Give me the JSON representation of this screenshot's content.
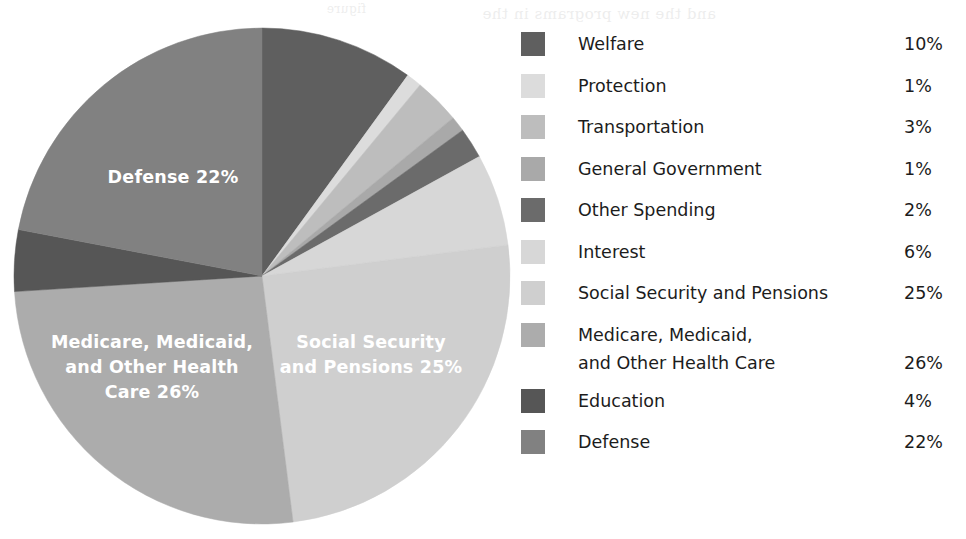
{
  "chart_data": {
    "type": "pie",
    "title": "",
    "subtitle": "",
    "xlabel": "",
    "ylabel": "",
    "legend_position": "right",
    "grid": false,
    "unit": "%",
    "total": 100,
    "categories": [
      "Welfare",
      "Protection",
      "Transportation",
      "General Government",
      "Other Spending",
      "Interest",
      "Social Security and Pensions",
      "Medicare, Medicaid, and Other Health Care",
      "Education",
      "Defense"
    ],
    "values": [
      10,
      1,
      3,
      1,
      2,
      6,
      25,
      26,
      4,
      22
    ],
    "colors": [
      "#5f5f5f",
      "#dcdcdc",
      "#bdbdbd",
      "#a9a9a9",
      "#6b6b6b",
      "#d7d7d7",
      "#cfcfcf",
      "#acacac",
      "#565656",
      "#818181"
    ],
    "slices": [
      {
        "label": "Welfare",
        "value": 10,
        "display": "10%",
        "color": "#5f5f5f"
      },
      {
        "label": "Protection",
        "value": 1,
        "display": "1%",
        "color": "#dcdcdc"
      },
      {
        "label": "Transportation",
        "value": 3,
        "display": "3%",
        "color": "#bdbdbd"
      },
      {
        "label": "General Government",
        "value": 1,
        "display": "1%",
        "color": "#a9a9a9"
      },
      {
        "label": "Other Spending",
        "value": 2,
        "display": "2%",
        "color": "#6b6b6b"
      },
      {
        "label": "Interest",
        "value": 6,
        "display": "6%",
        "color": "#d7d7d7"
      },
      {
        "label": "Social Security and Pensions",
        "value": 25,
        "display": "25%",
        "color": "#cfcfcf"
      },
      {
        "label": "Medicare, Medicaid, and Other Health Care",
        "value": 26,
        "display": "26%",
        "color": "#acacac"
      },
      {
        "label": "Education",
        "value": 4,
        "display": "4%",
        "color": "#565656"
      },
      {
        "label": "Defense",
        "value": 22,
        "display": "22%",
        "color": "#818181"
      }
    ]
  },
  "pie_labels": {
    "defense": "Defense 22%",
    "social_security_line1": "Social Security",
    "social_security_line2": "and Pensions 25%",
    "medicare_line1": "Medicare, Medicaid,",
    "medicare_line2": "and Other Health",
    "medicare_line3": "Care 26%"
  },
  "legend": {
    "items": [
      {
        "label": "Welfare",
        "value": "10%",
        "color": "#5f5f5f",
        "two_line": false
      },
      {
        "label": "Protection",
        "value": "1%",
        "color": "#dcdcdc",
        "two_line": false
      },
      {
        "label": "Transportation",
        "value": "3%",
        "color": "#bdbdbd",
        "two_line": false
      },
      {
        "label": "General Government",
        "value": "1%",
        "color": "#a9a9a9",
        "two_line": false
      },
      {
        "label": "Other Spending",
        "value": "2%",
        "color": "#6b6b6b",
        "two_line": false
      },
      {
        "label": "Interest",
        "value": "6%",
        "color": "#d7d7d7",
        "two_line": false
      },
      {
        "label": "Social Security and Pensions",
        "value": "25%",
        "color": "#cfcfcf",
        "two_line": false
      },
      {
        "label": "Medicare, Medicaid,\nand Other Health Care",
        "value": "26%",
        "color": "#acacac",
        "two_line": true
      },
      {
        "label": "Education",
        "value": "4%",
        "color": "#565656",
        "two_line": false
      },
      {
        "label": "Defense",
        "value": "22%",
        "color": "#818181",
        "two_line": false
      }
    ]
  },
  "background": "#ffffff"
}
